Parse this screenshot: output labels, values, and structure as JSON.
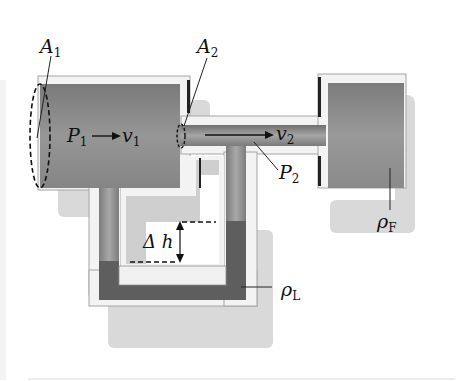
{
  "diagram": {
    "labels": {
      "area_inlet": {
        "symbol": "A",
        "sub": "1"
      },
      "area_throat": {
        "symbol": "A",
        "sub": "2"
      },
      "pressure_inlet": {
        "symbol": "P",
        "sub": "1"
      },
      "velocity_inlet": {
        "symbol": "v",
        "sub": "1"
      },
      "velocity_throat": {
        "symbol": "v",
        "sub": "2"
      },
      "pressure_throat": {
        "symbol": "P",
        "sub": "2"
      },
      "height_difference": {
        "symbol": "Δ h"
      },
      "fluid_density": {
        "symbol": "ρ",
        "sub": "F"
      },
      "liquid_density": {
        "symbol": "ρ",
        "sub": "L"
      }
    },
    "colors": {
      "fluid_gray": "#8a8a8a",
      "manometer_liquid": "#5c5c5c",
      "pipe_wall": "#f2f2f2",
      "pipe_wall_edge": "#9a9a9a",
      "shadow": "#d8d8d8",
      "background": "#ffffff"
    }
  }
}
